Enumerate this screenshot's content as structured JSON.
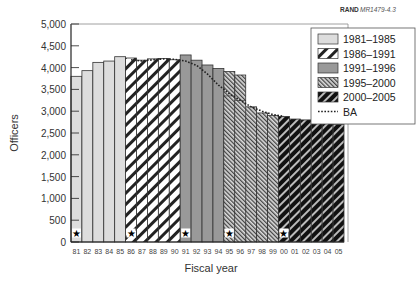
{
  "source_label": {
    "brand": "RAND",
    "code": "MR1479-4.3"
  },
  "chart_data": {
    "type": "bar",
    "title": "",
    "xlabel": "Fiscal year",
    "ylabel": "Officers",
    "ylim": [
      0,
      5000
    ],
    "yticks": [
      "0",
      "500",
      "1,000",
      "1,500",
      "2,000",
      "2,500",
      "3,000",
      "3,500",
      "4,000",
      "4,500",
      "5,000"
    ],
    "categories": [
      "81",
      "82",
      "83",
      "84",
      "85",
      "86",
      "87",
      "88",
      "89",
      "90",
      "91",
      "92",
      "93",
      "94",
      "95",
      "96",
      "97",
      "98",
      "99",
      "00",
      "01",
      "02",
      "03",
      "04",
      "05"
    ],
    "values": [
      3800,
      3930,
      4120,
      4150,
      4250,
      4220,
      4170,
      4200,
      4210,
      4180,
      4290,
      4170,
      4060,
      3980,
      3910,
      3830,
      3100,
      2960,
      2900,
      2880,
      2820,
      2800,
      2770,
      2730,
      2700
    ],
    "period_index": [
      0,
      0,
      0,
      0,
      0,
      1,
      1,
      1,
      1,
      1,
      2,
      2,
      2,
      2,
      3,
      3,
      3,
      3,
      3,
      4,
      4,
      4,
      4,
      4,
      4
    ],
    "overlay_1995_2000": [
      {
        "index": 14,
        "value": 3350
      },
      {
        "index": 15,
        "value": 3250
      }
    ],
    "ba_line": {
      "name": "BA",
      "x": [
        "86",
        "87",
        "88",
        "89",
        "90",
        "91",
        "92",
        "93",
        "94",
        "95",
        "96",
        "97",
        "98",
        "99",
        "00"
      ],
      "values": [
        4180,
        4150,
        4180,
        4200,
        4190,
        4150,
        4050,
        3850,
        3600,
        3400,
        3250,
        3100,
        3000,
        2920,
        2880
      ]
    },
    "stars": [
      "81",
      "86",
      "91",
      "95",
      "00"
    ],
    "legend": [
      {
        "label": "1981–1985",
        "pattern": "light-gray"
      },
      {
        "label": "1986–1991",
        "pattern": "white-diagonal"
      },
      {
        "label": "1991–1996",
        "pattern": "medium-gray"
      },
      {
        "label": "1995–2000",
        "pattern": "fine-diagonal"
      },
      {
        "label": "2000–2005",
        "pattern": "dark-diagonal"
      },
      {
        "label": "BA",
        "pattern": "dotted-line"
      }
    ],
    "legend_position": "top-right",
    "grid": false
  }
}
